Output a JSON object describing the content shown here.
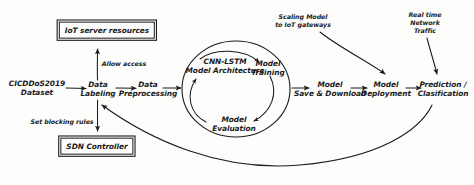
{
  "diagram": {
    "ink_color": "#1b1b1b",
    "background_color": "#fdfdfb"
  },
  "boxes": [
    {
      "id": "iot-server-resources",
      "label": "IoT server resources"
    },
    {
      "id": "sdn-controller",
      "label": "SDN Controller"
    }
  ],
  "pipeline": [
    {
      "id": "dataset",
      "label": "CICDDoS2019\nDataset"
    },
    {
      "id": "data-labeling",
      "label": "Data\nLabeling"
    },
    {
      "id": "data-preprocessing",
      "label": "Data\nPreprocessing"
    }
  ],
  "cycle": {
    "nodes": [
      {
        "id": "cnn-lstm-model-architecture",
        "label": "CNN-LSTM\nModel Architecture"
      },
      {
        "id": "model-training",
        "label": "Model\nTraining"
      },
      {
        "id": "model-evaluation",
        "label": "Model\nEvaluation"
      }
    ]
  },
  "deployment": [
    {
      "id": "model-save-download",
      "label": "Model\nSave & Download"
    },
    {
      "id": "model-deployment",
      "label": "Model\nDeployment"
    },
    {
      "id": "prediction-classification",
      "label": "Prediction /\nClasification"
    }
  ],
  "edge_labels": [
    {
      "id": "allow-access",
      "label": "Allow access"
    },
    {
      "id": "set-blocking-rules",
      "label": "Set blocking rules"
    },
    {
      "id": "scaling-model-to-iot-gateways",
      "label": "Scaling Model\nto IoT gateways"
    },
    {
      "id": "real-time-network-traffic",
      "label": "Real time\nNetwork Traffic"
    }
  ]
}
